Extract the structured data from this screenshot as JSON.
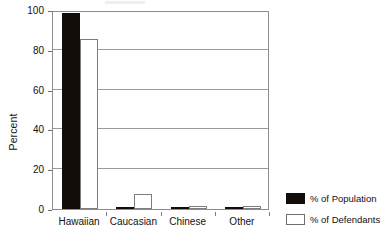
{
  "chart_data": {
    "type": "bar",
    "title": "",
    "xlabel": "",
    "ylabel": "Percent",
    "ylim": [
      0,
      100
    ],
    "yticks": [
      "0",
      "20",
      "40",
      "60",
      "80",
      "100"
    ],
    "ytick_values": [
      0,
      20,
      40,
      60,
      80,
      100
    ],
    "grid": true,
    "legend_position": "right",
    "categories": [
      "Hawaiian",
      "Caucasian",
      "Chinese",
      "Other"
    ],
    "series": [
      {
        "name": "% of Population",
        "color": "#120d08",
        "values": [
          98.5,
          1.0,
          0.5,
          0.5
        ]
      },
      {
        "name": "% of Defendants",
        "color": "#ffffff",
        "values": [
          85.5,
          7.5,
          1.5,
          1.5
        ]
      }
    ]
  },
  "axis": {
    "y_title": "Percent"
  },
  "legend": {
    "items": [
      {
        "label": "% of Population",
        "swatch": "filled-black-swatch"
      },
      {
        "label": "% of Defendants",
        "swatch": "outline-white-swatch"
      }
    ]
  }
}
